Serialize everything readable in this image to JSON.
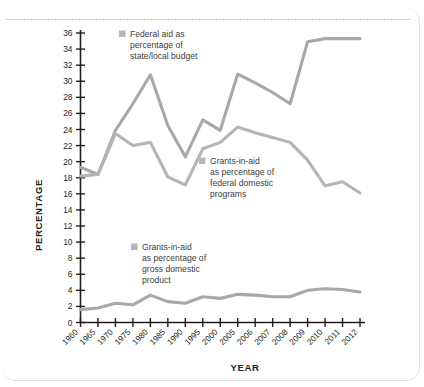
{
  "chart_data": {
    "type": "line",
    "title": "",
    "xlabel": "YEAR",
    "ylabel": "PERCENTAGE",
    "grid": false,
    "legend_position": "inline-annotations",
    "categories": [
      "1960",
      "1965",
      "1970",
      "1975",
      "1980",
      "1985",
      "1990",
      "1995",
      "2000",
      "2005",
      "2006",
      "2007",
      "2008",
      "2009",
      "2010",
      "2011",
      "2012"
    ],
    "ylim": [
      0,
      36
    ],
    "ytick_labels": [
      "0",
      "2",
      "4",
      "6",
      "8",
      "10",
      "12",
      "14",
      "16",
      "18",
      "20",
      "22",
      "24",
      "26",
      "28",
      "30",
      "32",
      "34",
      "36"
    ],
    "series": [
      {
        "name": "Federal aid as percentage of state/local budget",
        "color": "#a8a8a8",
        "values": [
          19.3,
          18.4,
          23.9,
          27.2,
          30.8,
          24.5,
          20.6,
          25.2,
          23.9,
          30.9,
          29.8,
          28.6,
          27.2,
          34.9,
          35.3,
          35.3,
          35.3
        ]
      },
      {
        "name": "Grants-in-aid as percentage of federal domestic programs",
        "color": "#b5b5b5",
        "values": [
          18.2,
          18.4,
          23.5,
          22.0,
          22.4,
          18.1,
          17.1,
          21.6,
          22.4,
          24.3,
          23.6,
          23.0,
          22.4,
          20.2,
          17.0,
          17.5,
          16.1
        ]
      },
      {
        "name": "Grants-in-aid as percentage of gross domestic product",
        "color": "#a8a8a8",
        "values": [
          1.6,
          1.8,
          2.4,
          2.2,
          3.4,
          2.6,
          2.4,
          3.2,
          3.0,
          3.5,
          3.4,
          3.2,
          3.2,
          4.0,
          4.2,
          4.1,
          3.8
        ]
      }
    ]
  },
  "axis": {
    "y_title": "PERCENTAGE",
    "x_title": "YEAR"
  },
  "legend": [
    {
      "id": "legend-federal-aid",
      "lines": [
        "Federal aid as",
        "percentage of",
        "state/local budget"
      ],
      "swatch_color": "#b6b6b6"
    },
    {
      "id": "legend-federal-domestic",
      "lines": [
        "Grants-in-aid",
        "as percentage of",
        "federal domestic",
        "programs"
      ],
      "swatch_color": "#b6b6b6"
    },
    {
      "id": "legend-gdp",
      "lines": [
        "Grants-in-aid",
        "as percentage of",
        "gross domestic",
        "product"
      ],
      "swatch_color": "#b6b6b6"
    }
  ]
}
